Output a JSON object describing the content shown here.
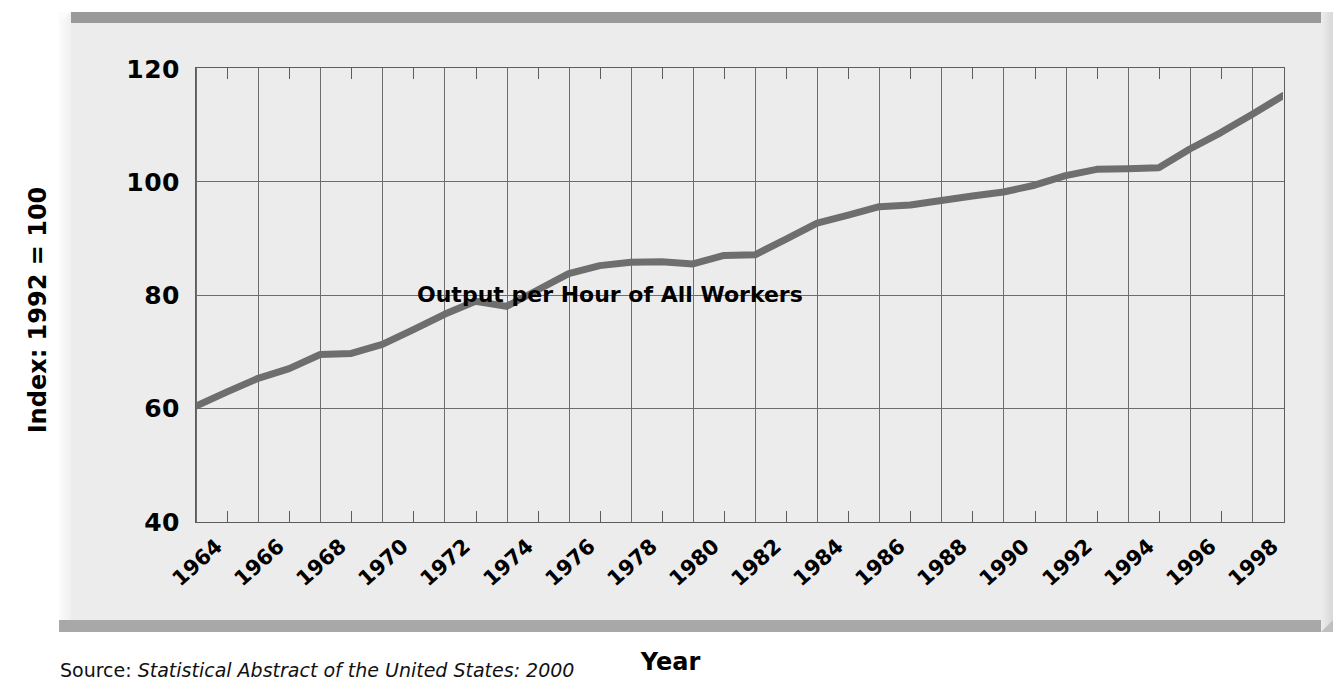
{
  "chart_data": {
    "type": "line",
    "title": "",
    "annotation": "Output per Hour of All Workers",
    "xlabel": "Year",
    "ylabel": "Index: 1992 = 100",
    "xlim": [
      1964,
      1999
    ],
    "ylim": [
      40,
      120
    ],
    "yticks": [
      120,
      100,
      80,
      60,
      40
    ],
    "xticks": [
      1964,
      1966,
      1968,
      1970,
      1972,
      1974,
      1976,
      1978,
      1980,
      1982,
      1984,
      1986,
      1988,
      1990,
      1992,
      1994,
      1996,
      1998
    ],
    "grid": true,
    "legend_position": "none",
    "minor_ticks": "odd years",
    "series": [
      {
        "name": "Output per Hour of All Workers",
        "color": "#6e6e6e",
        "x": [
          1964,
          1965,
          1966,
          1967,
          1968,
          1969,
          1970,
          1971,
          1972,
          1973,
          1974,
          1975,
          1976,
          1977,
          1978,
          1979,
          1980,
          1981,
          1982,
          1983,
          1984,
          1985,
          1986,
          1987,
          1988,
          1989,
          1990,
          1991,
          1992,
          1993,
          1994,
          1995,
          1996,
          1997,
          1998,
          1999
        ],
        "values": [
          60.3,
          62.8,
          65.2,
          66.9,
          69.4,
          69.6,
          71.2,
          73.8,
          76.5,
          78.8,
          77.9,
          80.8,
          83.7,
          85.1,
          85.7,
          85.8,
          85.4,
          86.9,
          87.0,
          89.8,
          92.6,
          94.0,
          95.5,
          95.8,
          96.6,
          97.4,
          98.1,
          99.3,
          101.0,
          102.1,
          102.2,
          102.4,
          105.7,
          108.6,
          111.8,
          115.1
        ]
      }
    ]
  },
  "axis": {
    "y_title": "Index: 1992 = 100",
    "x_title": "Year",
    "y_tick_labels": [
      "120",
      "100",
      "80",
      "60",
      "40"
    ],
    "x_tick_labels": [
      "1964",
      "1966",
      "1968",
      "1970",
      "1972",
      "1974",
      "1976",
      "1978",
      "1980",
      "1982",
      "1984",
      "1986",
      "1988",
      "1990",
      "1992",
      "1994",
      "1996",
      "1998"
    ]
  },
  "annotation": {
    "series_label": "Output per Hour of All Workers"
  },
  "source": {
    "prefix": "Source: ",
    "title": "Statistical Abstract of the United States: 2000"
  },
  "colors": {
    "line": "#6e6e6e",
    "grid": "#6d6d6d",
    "axis": "#5c5c5c",
    "panel": "#ececec",
    "bevel_dark": "#9a9a9a",
    "bevel_light": "#fbfbfb",
    "text": "#000000"
  }
}
